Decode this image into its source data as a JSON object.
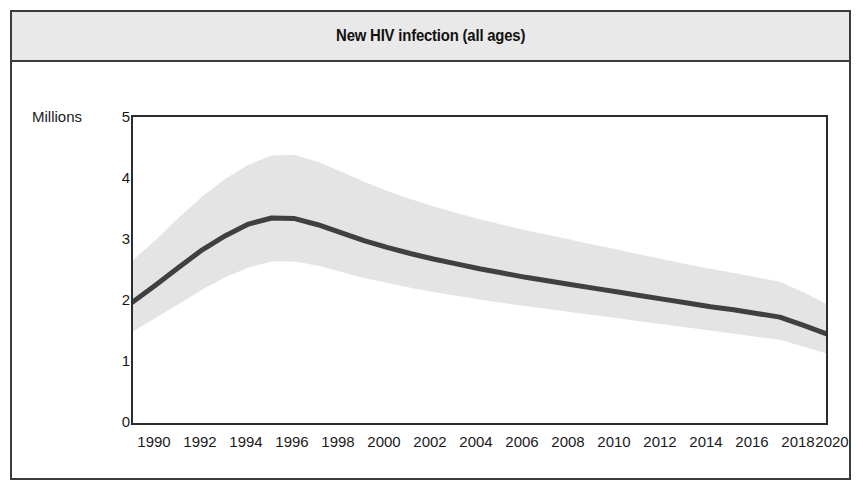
{
  "figure": {
    "title": "New HIV infection (all ages)"
  },
  "axes": {
    "y_unit_label": "Millions",
    "y_ticks": [
      "5",
      "4",
      "3",
      "2",
      "1",
      "0"
    ],
    "x_ticks": [
      "1990",
      "1992",
      "1994",
      "1996",
      "1998",
      "2000",
      "2002",
      "2004",
      "2006",
      "2008",
      "2010",
      "2012",
      "2014",
      "2016",
      "2018",
      "2020"
    ]
  },
  "style": {
    "line_color": "#404040",
    "band_color": "#e4e4e4",
    "frame_color": "#2c2c2c",
    "header_bg": "#e9e9e9",
    "page_bg": "#ffffff"
  },
  "chart_data": {
    "type": "line",
    "title": "New HIV infection (all ages)",
    "xlabel": "",
    "ylabel": "Millions",
    "ylim": [
      0,
      5
    ],
    "xlim": [
      1990,
      2020
    ],
    "grid": false,
    "legend": "none",
    "x": [
      1990,
      1991,
      1992,
      1993,
      1994,
      1995,
      1996,
      1997,
      1998,
      1999,
      2000,
      2001,
      2002,
      2003,
      2004,
      2005,
      2006,
      2007,
      2008,
      2009,
      2010,
      2011,
      2012,
      2013,
      2014,
      2015,
      2016,
      2017,
      2018,
      2019,
      2020
    ],
    "series": [
      {
        "name": "New HIV infections (estimate)",
        "values": [
          1.98,
          2.26,
          2.55,
          2.83,
          3.06,
          3.25,
          3.35,
          3.34,
          3.24,
          3.11,
          2.98,
          2.87,
          2.77,
          2.68,
          2.6,
          2.52,
          2.45,
          2.38,
          2.32,
          2.26,
          2.2,
          2.14,
          2.08,
          2.02,
          1.96,
          1.9,
          1.85,
          1.79,
          1.73,
          1.6,
          1.46
        ]
      },
      {
        "name": "Uncertainty band - upper bound",
        "values": [
          2.66,
          3.0,
          3.36,
          3.7,
          3.99,
          4.22,
          4.37,
          4.38,
          4.27,
          4.11,
          3.94,
          3.79,
          3.66,
          3.54,
          3.43,
          3.33,
          3.24,
          3.15,
          3.07,
          2.99,
          2.91,
          2.83,
          2.75,
          2.67,
          2.59,
          2.52,
          2.45,
          2.38,
          2.31,
          2.14,
          1.95
        ]
      },
      {
        "name": "Uncertainty band - lower bound",
        "values": [
          1.5,
          1.72,
          1.95,
          2.18,
          2.38,
          2.54,
          2.64,
          2.64,
          2.57,
          2.47,
          2.37,
          2.29,
          2.21,
          2.14,
          2.08,
          2.02,
          1.96,
          1.91,
          1.86,
          1.81,
          1.76,
          1.71,
          1.66,
          1.61,
          1.56,
          1.51,
          1.46,
          1.41,
          1.36,
          1.25,
          1.14
        ]
      }
    ]
  }
}
